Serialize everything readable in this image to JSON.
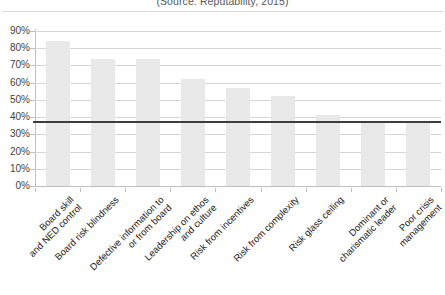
{
  "caption": {
    "source": "(Source: Reputability, 2015)"
  },
  "chart_data": {
    "type": "bar",
    "title": "",
    "subtitle": "(Source: Reputability, 2015)",
    "xlabel": "",
    "ylabel": "",
    "ylim": [
      0,
      90
    ],
    "grid": true,
    "legend": false,
    "categories": [
      "Board skill\nand NED control",
      "Board risk blindness",
      "Defective information to\nor from board",
      "Leadership on ethos\nand culture",
      "Risk from incentives",
      "Risk from complexity",
      "Risk glass ceiling",
      "Dominant or\ncharismatic leader",
      "Poor crisis\nmanagement"
    ],
    "values": [
      84,
      74,
      74,
      62,
      57,
      52,
      41,
      37,
      37
    ],
    "value_unit": "%",
    "tick_labels": [
      "0%",
      "10%",
      "20%",
      "30%",
      "40%",
      "50%",
      "60%",
      "70%",
      "80%",
      "90%"
    ],
    "tick_values": [
      0,
      10,
      20,
      30,
      40,
      50,
      60,
      70,
      80,
      90
    ],
    "threshold_line": {
      "value": 38,
      "label": "",
      "color": "#3d3d3d"
    },
    "colors": {
      "bar": "#e9e9e9",
      "gridline": "#d6d6d6",
      "axis": "#bfbfbf",
      "text": "#222222",
      "threshold": "#3d3d3d"
    }
  }
}
